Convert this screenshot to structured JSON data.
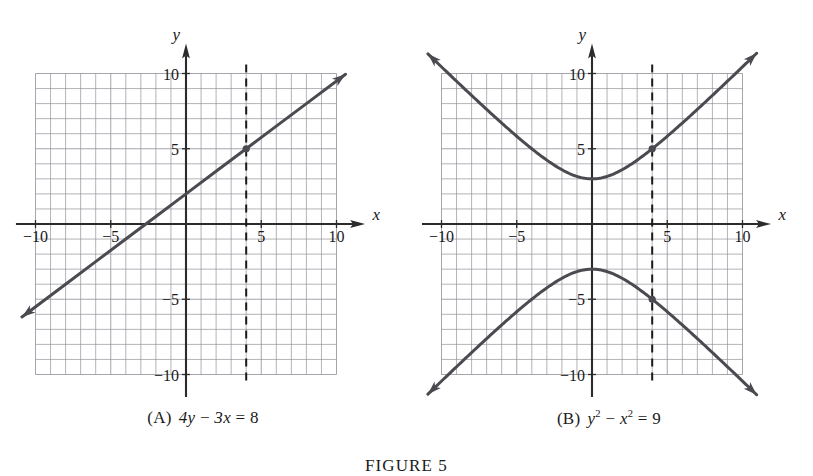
{
  "figure": {
    "label": "FIGURE 5",
    "panels": [
      {
        "id": "A",
        "tag": "(A)",
        "equation_plain": "4y − 3x = 8",
        "equation_parts": {
          "a": "4y",
          "op1": " − ",
          "b": "3x",
          "op2": " = ",
          "c": "8"
        },
        "curve_type": "line",
        "x_axis_label": "x",
        "y_axis_label": "y",
        "x_ticks": [
          "-10",
          "-5",
          "5",
          "10"
        ],
        "y_ticks": [
          "10",
          "5",
          "-5",
          "-10"
        ],
        "marker_points": [
          [
            4,
            5
          ]
        ],
        "dashed_x": 4
      },
      {
        "id": "B",
        "tag": "(B)",
        "equation_plain": "y² − x² = 9",
        "equation_parts": {
          "a": "y",
          "a_sup": "2",
          "op1": " − ",
          "b": "x",
          "b_sup": "2",
          "op2": " = ",
          "c": "9"
        },
        "curve_type": "hyperbola",
        "x_axis_label": "x",
        "y_axis_label": "y",
        "x_ticks": [
          "-10",
          "-5",
          "5",
          "10"
        ],
        "y_ticks": [
          "10",
          "5",
          "-5",
          "-10"
        ],
        "marker_points": [
          [
            4,
            5
          ],
          [
            4,
            -5
          ]
        ],
        "dashed_x": 4
      }
    ]
  },
  "chart_data": [
    {
      "type": "line",
      "title": "(A)  4y − 3x = 8",
      "equation": "4y - 3x = 8",
      "explicit_form": "y = (3x + 8) / 4",
      "slope": 0.75,
      "y_intercept": 2,
      "x_intercept": -2.6667,
      "xlabel": "x",
      "ylabel": "y",
      "xlim": [
        -10.9,
        10.6
      ],
      "ylim": [
        -10.9,
        10.6
      ],
      "grid": true,
      "grid_step": 1,
      "grid_extent": {
        "x": [
          -10.9,
          10.6
        ],
        "y": [
          -10.6,
          10.6
        ]
      },
      "xticks": [
        -10,
        -5,
        5,
        10
      ],
      "yticks": [
        -10,
        -5,
        5,
        10
      ],
      "x": [
        -10.9,
        -8,
        -6,
        -4,
        -2,
        0,
        2,
        4,
        6,
        8,
        10.6
      ],
      "values": [
        -6.175,
        -4.0,
        -2.5,
        -1.0,
        0.5,
        2.0,
        3.5,
        5.0,
        6.5,
        8.0,
        9.95
      ],
      "annotations": [
        {
          "kind": "point-marker",
          "x": 4,
          "y": 5,
          "label": ""
        },
        {
          "kind": "dashed-vertical",
          "x": 4,
          "y_from": -10.6,
          "y_to": 10.6
        }
      ],
      "legend": null
    },
    {
      "type": "line",
      "title": "(B)  y² − x² = 9",
      "equation": "y^2 - x^2 = 9",
      "explicit_form": "y = ± sqrt(x^2 + 9)",
      "xlabel": "x",
      "ylabel": "y",
      "xlim": [
        -10.9,
        10.6
      ],
      "ylim": [
        -10.9,
        10.6
      ],
      "grid": true,
      "grid_step": 1,
      "grid_extent": {
        "x": [
          -10.9,
          10.6
        ],
        "y": [
          -10.6,
          10.6
        ]
      },
      "xticks": [
        -10,
        -5,
        5,
        10
      ],
      "yticks": [
        -10,
        -5,
        5,
        10
      ],
      "series": [
        {
          "name": "upper branch y = +sqrt(x^2+9)",
          "x": [
            -10,
            -8,
            -6,
            -4,
            -2,
            0,
            2,
            4,
            6,
            8,
            10
          ],
          "values": [
            10.44,
            8.54,
            6.71,
            5.0,
            3.61,
            3.0,
            3.61,
            5.0,
            6.71,
            8.54,
            10.44
          ]
        },
        {
          "name": "lower branch y = -sqrt(x^2+9)",
          "x": [
            -10,
            -8,
            -6,
            -4,
            -2,
            0,
            2,
            4,
            6,
            8,
            10
          ],
          "values": [
            -10.44,
            -8.54,
            -6.71,
            -5.0,
            -3.61,
            -3.0,
            -3.61,
            -5.0,
            -6.71,
            -8.54,
            -10.44
          ]
        }
      ],
      "vertices": [
        [
          0,
          3
        ],
        [
          0,
          -3
        ]
      ],
      "annotations": [
        {
          "kind": "point-marker",
          "x": 4,
          "y": 5,
          "label": ""
        },
        {
          "kind": "point-marker",
          "x": 4,
          "y": -5,
          "label": ""
        },
        {
          "kind": "dashed-vertical",
          "x": 4,
          "y_from": -10.6,
          "y_to": 10.6
        }
      ],
      "legend": null
    }
  ],
  "colors": {
    "ink": "#1a1a1a",
    "curve": "#4a4a50",
    "axis": "#2b2b2b",
    "grid": "#8e8e96",
    "background": "#ffffff"
  }
}
